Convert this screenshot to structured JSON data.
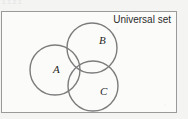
{
  "figure": {
    "width": 188,
    "height": 119,
    "background_color": "#f4f4f3",
    "top_caption": "1.1.2.1",
    "diagram_type": "venn-diagram"
  },
  "universal_set": {
    "label": "Universal set",
    "border_color": "#9a9a9a",
    "fill_color": "#fbfbfa",
    "rect": {
      "x": 1,
      "y": 11,
      "width": 176,
      "height": 102
    }
  },
  "sets": [
    {
      "id": "A",
      "label": "A",
      "cx": 55,
      "cy": 70,
      "r": 25,
      "label_x": 53,
      "label_y": 73,
      "stroke_color": "#7c7c7c"
    },
    {
      "id": "B",
      "label": "B",
      "cx": 92,
      "cy": 48,
      "r": 25,
      "label_x": 99,
      "label_y": 44,
      "stroke_color": "#7c7c7c"
    },
    {
      "id": "C",
      "label": "C",
      "cx": 93,
      "cy": 86,
      "r": 25,
      "label_x": 100,
      "label_y": 95,
      "stroke_color": "#7c7c7c"
    }
  ],
  "stroke_width": 1.4
}
